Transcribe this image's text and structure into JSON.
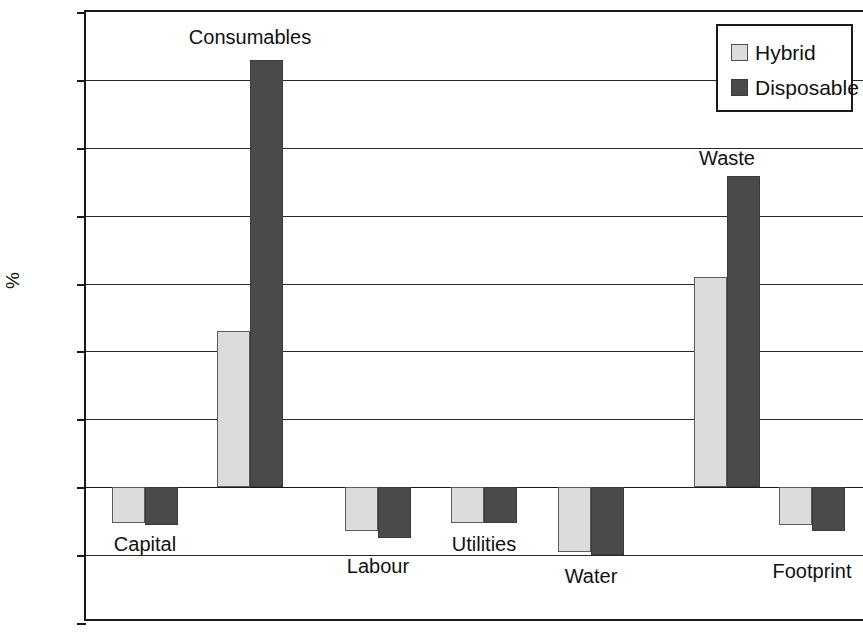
{
  "chart_data": {
    "type": "bar",
    "title": "",
    "xlabel": "",
    "ylabel": "%",
    "ylim": [
      -200,
      700
    ],
    "ytick_step": 100,
    "yticks": [
      700,
      600,
      500,
      400,
      300,
      200,
      100,
      0,
      -100,
      -200
    ],
    "ytick_labels": [
      "700",
      "600",
      "500",
      "400",
      "300",
      "200",
      "100",
      "0",
      "−100",
      "−200"
    ],
    "grid": true,
    "grid_axis": "y",
    "legend_position": "top-right",
    "categories": [
      "Capital",
      "Consumables",
      "Labour",
      "Utilities",
      "Water",
      "Waste",
      "Footprint"
    ],
    "series": [
      {
        "name": "Hybrid",
        "color": "#dcdcdc",
        "values": [
          -52,
          230,
          -65,
          -52,
          -96,
          310,
          -55
        ]
      },
      {
        "name": "Disposable",
        "color": "#4a4a4a",
        "values": [
          -55,
          630,
          -75,
          -52,
          -100,
          458,
          -65
        ]
      }
    ]
  },
  "legend": {
    "entries": [
      {
        "label": "Hybrid",
        "swatch": "hybrid-swatch-icon"
      },
      {
        "label": "Disposable",
        "swatch": "disposable-swatch-icon"
      }
    ]
  },
  "axis": {
    "y_title": "%"
  },
  "category_labels": [
    {
      "text": "Capital",
      "x": 143,
      "y": 531,
      "placement": "below-zero-inline"
    },
    {
      "text": "Consumables",
      "x": 248,
      "y": 24,
      "placement": "above-bar"
    },
    {
      "text": "Labour",
      "x": 376,
      "y": 553,
      "placement": "below"
    },
    {
      "text": "Utilities",
      "x": 482,
      "y": 531,
      "placement": "inline"
    },
    {
      "text": "Water",
      "x": 589,
      "y": 563,
      "placement": "below"
    },
    {
      "text": "Waste",
      "x": 725,
      "y": 145,
      "placement": "above-bar"
    },
    {
      "text": "Footprint",
      "x": 810,
      "y": 558,
      "placement": "below"
    }
  ]
}
